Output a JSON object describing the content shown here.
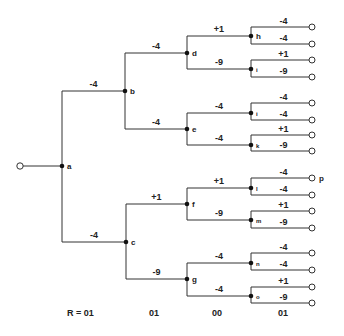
{
  "diagram": {
    "type": "binary-decision-tree",
    "colors": {
      "line": "#333333",
      "node": "#111111",
      "leaf_fill": "#ffffff",
      "text": "#222222"
    },
    "root": {
      "id": "root",
      "x": 20,
      "y": 166
    },
    "nodes": [
      {
        "id": "a",
        "label": "a",
        "x": 62,
        "y": 166,
        "parent": "root",
        "weight": ""
      },
      {
        "id": "b",
        "label": "b",
        "x": 125,
        "y": 91,
        "parent": "a",
        "weight": "-4"
      },
      {
        "id": "c",
        "label": "c",
        "x": 126,
        "y": 242,
        "parent": "a",
        "weight": "-4"
      },
      {
        "id": "d",
        "label": "d",
        "x": 187,
        "y": 53,
        "parent": "b",
        "weight": "-4"
      },
      {
        "id": "e",
        "label": "e",
        "x": 187,
        "y": 129,
        "parent": "b",
        "weight": "-4"
      },
      {
        "id": "f",
        "label": "f",
        "x": 187,
        "y": 204,
        "parent": "c",
        "weight": "+1"
      },
      {
        "id": "g",
        "label": "g",
        "x": 187,
        "y": 279,
        "parent": "c",
        "weight": "-9"
      },
      {
        "id": "h",
        "label": "h",
        "x": 251,
        "y": 36,
        "parent": "d",
        "weight": "+1"
      },
      {
        "id": "i",
        "label": "i",
        "x": 251,
        "y": 69,
        "parent": "d",
        "weight": "-9",
        "small": true
      },
      {
        "id": "j",
        "label": "i",
        "x": 251,
        "y": 113,
        "parent": "e",
        "weight": "-4",
        "small": true
      },
      {
        "id": "k",
        "label": "k",
        "x": 251,
        "y": 145,
        "parent": "e",
        "weight": "-4",
        "small": true
      },
      {
        "id": "l",
        "label": "l",
        "x": 251,
        "y": 188,
        "parent": "f",
        "weight": "+1",
        "small": true
      },
      {
        "id": "m",
        "label": "m",
        "x": 251,
        "y": 220,
        "parent": "f",
        "weight": "-9",
        "small": true
      },
      {
        "id": "n",
        "label": "n",
        "x": 251,
        "y": 263,
        "parent": "g",
        "weight": "-4",
        "small": true
      },
      {
        "id": "o",
        "label": "o",
        "x": 251,
        "y": 296,
        "parent": "g",
        "weight": "-4",
        "small": true
      }
    ],
    "leaves": [
      {
        "parent": "h",
        "y": 27,
        "weight": "-4",
        "label": ""
      },
      {
        "parent": "h",
        "y": 44,
        "weight": "-4",
        "label": ""
      },
      {
        "parent": "i",
        "y": 60,
        "weight": "+1",
        "label": ""
      },
      {
        "parent": "i",
        "y": 77,
        "weight": "-9",
        "label": ""
      },
      {
        "parent": "j",
        "y": 103,
        "weight": "-4",
        "label": ""
      },
      {
        "parent": "j",
        "y": 120,
        "weight": "-4",
        "label": ""
      },
      {
        "parent": "k",
        "y": 135,
        "weight": "+1",
        "label": ""
      },
      {
        "parent": "k",
        "y": 151,
        "weight": "-9",
        "label": ""
      },
      {
        "parent": "l",
        "y": 178,
        "weight": "-4",
        "label": "p"
      },
      {
        "parent": "l",
        "y": 195,
        "weight": "-4",
        "label": ""
      },
      {
        "parent": "m",
        "y": 211,
        "weight": "+1",
        "label": ""
      },
      {
        "parent": "m",
        "y": 228,
        "weight": "-9",
        "label": ""
      },
      {
        "parent": "n",
        "y": 253,
        "weight": "-4",
        "label": ""
      },
      {
        "parent": "n",
        "y": 270,
        "weight": "-4",
        "label": ""
      },
      {
        "parent": "o",
        "y": 287,
        "weight": "+1",
        "label": ""
      },
      {
        "parent": "o",
        "y": 303,
        "weight": "-9",
        "label": ""
      }
    ],
    "leaf_x": 312,
    "bottom_labels": [
      {
        "text": "R = 01",
        "x": 67
      },
      {
        "text": "01",
        "x": 149
      },
      {
        "text": "00",
        "x": 212
      },
      {
        "text": "01",
        "x": 278
      }
    ],
    "bottom_y": 316
  }
}
